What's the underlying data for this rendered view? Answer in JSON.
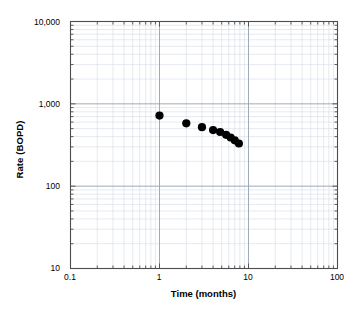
{
  "chart_data": {
    "type": "scatter",
    "title": "",
    "xlabel": "Time (months)",
    "ylabel": "Rate (BOPD)",
    "xscale": "log",
    "yscale": "log",
    "xlim": [
      0.1,
      100
    ],
    "ylim": [
      10,
      10000
    ],
    "grid": true,
    "minor_grid": true,
    "legend": "none",
    "marker": "filled-circle",
    "marker_color": "#000000",
    "x": [
      1.0,
      2.0,
      3.0,
      4.0,
      4.8,
      5.6,
      6.3,
      7.0,
      7.8
    ],
    "y": [
      720,
      580,
      520,
      480,
      455,
      420,
      390,
      360,
      330
    ],
    "points": [
      {
        "x": 1.0,
        "y": 720
      },
      {
        "x": 2.0,
        "y": 580
      },
      {
        "x": 3.0,
        "y": 520
      },
      {
        "x": 4.0,
        "y": 480
      },
      {
        "x": 4.8,
        "y": 455
      },
      {
        "x": 5.6,
        "y": 420
      },
      {
        "x": 6.3,
        "y": 390
      },
      {
        "x": 7.0,
        "y": 360
      },
      {
        "x": 7.8,
        "y": 330
      }
    ],
    "xticks": [
      {
        "value": 0.1,
        "label": "0.1"
      },
      {
        "value": 1,
        "label": "1"
      },
      {
        "value": 10,
        "label": "10"
      },
      {
        "value": 100,
        "label": "100"
      }
    ],
    "yticks": [
      {
        "value": 10,
        "label": "10"
      },
      {
        "value": 100,
        "label": "100"
      },
      {
        "value": 1000,
        "label": "1,000"
      },
      {
        "value": 10000,
        "label": "10,000"
      }
    ],
    "colors": {
      "axis": "#4d4d4d",
      "major_grid": "#9aa6b5",
      "minor_grid": "#d5dce5",
      "marker": "#000000",
      "background": "#ffffff"
    }
  },
  "caption": ""
}
